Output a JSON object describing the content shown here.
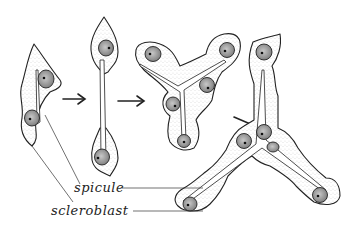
{
  "figure": {
    "stages": [
      {
        "id": 1,
        "description": "scleroblast with two nuclei and initial spicule"
      },
      {
        "id": 2,
        "description": "elongated spicule between two cells"
      },
      {
        "id": 3,
        "description": "tri-radiate spicule forming in cell cluster"
      },
      {
        "id": 4,
        "description": "mature tri-radiate spicule with scleroblasts at tips"
      }
    ],
    "arrows": 3,
    "labels": {
      "spicule": "spicule",
      "scleroblast": "scleroblast"
    },
    "colors": {
      "ink": "#222222",
      "background": "#ffffff",
      "nucleus": "#9a9a9a"
    }
  }
}
